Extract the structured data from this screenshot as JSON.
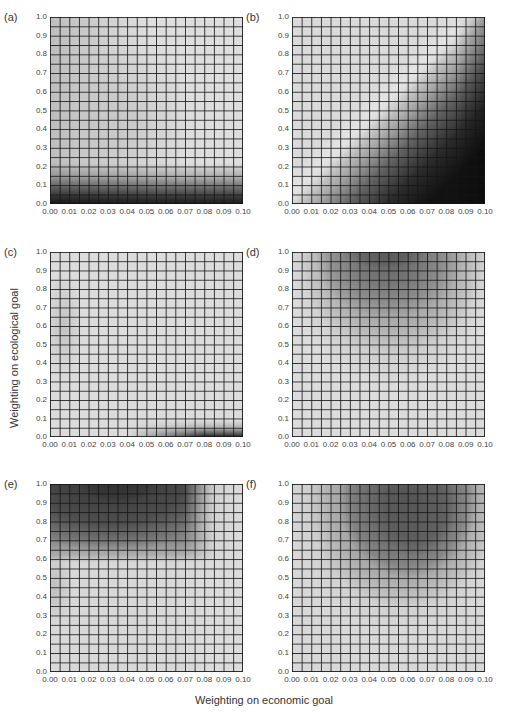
{
  "figure": {
    "xlabel": "Weighting on economic goal",
    "ylabel": "Weighting on ecological goal"
  },
  "chart_data": {
    "type": "heatmap",
    "xlabel": "Weighting on economic goal",
    "ylabel": "Weighting on ecological goal",
    "x_ticks": [
      "0.00",
      "0.01",
      "0.02",
      "0.03",
      "0.04",
      "0.05",
      "0.06",
      "0.07",
      "0.08",
      "0.09",
      "0.10"
    ],
    "y_ticks": [
      "0.0",
      "0.1",
      "0.2",
      "0.3",
      "0.4",
      "0.5",
      "0.6",
      "0.7",
      "0.8",
      "0.9",
      "1.0"
    ],
    "xlim": [
      0,
      0.1
    ],
    "ylim": [
      0,
      1.0
    ],
    "grid": {
      "x_step": 0.005,
      "y_step": 0.05,
      "cols": 20,
      "rows": 20
    },
    "colormap": "grayscale (dark = high)",
    "panels": [
      {
        "label": "(a)",
        "description": "Mostly light; dark band along bottom (ecological weight < ~0.1), darkest at low economic weight",
        "base": "#dedede",
        "layers": [
          "linear-gradient(to top, #1a1a1a 0%, #3a3a3a 4%, #6e6e6e 9%, #a8a8a8 14%, rgba(200,200,200,0) 22%)",
          "linear-gradient(to right, rgba(0,0,0,0.15) 0%, rgba(0,0,0,0) 50%)",
          "radial-gradient(ellipse 30% 45% at 45% 55%, rgba(0,0,0,0.08), rgba(0,0,0,0))"
        ]
      },
      {
        "label": "(b)",
        "description": "Light upper-left; dark diagonal region toward lower-right (high economic, low ecological weight)",
        "base": "#dadada",
        "layers": [
          "linear-gradient(135deg, rgba(0,0,0,0) 48%, rgba(0,0,0,0.25) 56%, rgba(0,0,0,0.55) 64%, rgba(0,0,0,0.8) 74%, rgba(0,0,0,0.92) 85%)",
          "linear-gradient(to left, rgba(0,0,0,0.25) 0%, rgba(0,0,0,0) 15%)",
          "linear-gradient(135deg, rgba(255,255,255,0) 40%, rgba(255,255,255,0.25) 46%, rgba(255,255,255,0) 52%)"
        ]
      },
      {
        "label": "(c)",
        "description": "Mostly light; faint vertical shading near economic 0.00-0.02 for mid ecological; dark wedge lower-right near ecological 0.0",
        "base": "#dcdcdc",
        "layers": [
          "linear-gradient(to top, rgba(0,0,0,0.85) 0%, rgba(0,0,0,0.5) 2.5%, rgba(0,0,0,0.2) 5%, rgba(0,0,0,0) 9%)",
          "linear-gradient(to right, rgba(220,220,220,1) 0%, rgba(220,220,220,1) 40%, rgba(220,220,220,0) 80%)",
          "radial-gradient(ellipse 10% 30% at 7% 40%, rgba(0,0,0,0.12), rgba(0,0,0,0))"
        ]
      },
      {
        "label": "(d)",
        "description": "Dark hump centered near economic 0.045-0.055 at ecological 1.0, lighter concentric bands down to ~0.45",
        "base": "#dcdcdc",
        "layers": [
          "radial-gradient(ellipse 22% 9% at 48% 0%, #1a1a1a 0%, #2e2e2e 60%, rgba(46,46,46,0) 100%)",
          "radial-gradient(ellipse 38% 34% at 50% 2%, rgba(40,40,40,0.9) 0%, rgba(70,70,70,0.75) 45%, rgba(100,100,100,0.55) 75%, rgba(120,120,120,0) 100%)",
          "radial-gradient(ellipse 48% 56% at 52% 0%, rgba(90,90,90,0.5) 0%, rgba(120,120,120,0.45) 70%, rgba(150,150,150,0) 100%)",
          "radial-gradient(ellipse 55% 72% at 52% 0%, rgba(150,150,150,0.3) 0%, rgba(170,170,170,0.25) 80%, rgba(190,190,190,0) 100%)"
        ]
      },
      {
        "label": "(e)",
        "description": "Darkest at top around economic 0.03-0.04 (ecological ~1.0); dark band for ecological > ~0.65 across economic 0.00-0.08; light elsewhere",
        "base": "#d8d8d8",
        "layers": [
          "radial-gradient(ellipse 20% 10% at 36% 0%, #151515 0%, #252525 70%, rgba(37,37,37,0) 100%)",
          "radial-gradient(ellipse 60% 36% at 32% 0%, rgba(30,30,30,0.9) 0%, rgba(60,60,60,0.8) 60%, rgba(80,80,80,0) 100%)",
          "linear-gradient(to bottom, rgba(60,60,60,0.7) 0%, rgba(80,80,80,0.6) 30%, rgba(100,100,100,0.35) 38%, rgba(120,120,120,0) 42%)",
          "linear-gradient(to left, rgba(220,220,220,1) 0%, rgba(220,220,220,0.9) 15%, rgba(220,220,220,0) 30%)",
          "radial-gradient(ellipse 10% 20% at 2% 55%, rgba(0,0,0,0.12), rgba(0,0,0,0))"
        ]
      },
      {
        "label": "(f)",
        "description": "Dark region centered near economic 0.06-0.065 at ecological ~0.8-1.0; concentric lighter bands down to ~0.5",
        "base": "#d8d8d8",
        "layers": [
          "radial-gradient(ellipse 22% 26% at 64% 12%, #111111 0%, #1e1e1e 70%, rgba(30,30,30,0) 100%)",
          "radial-gradient(ellipse 36% 42% at 60% 8%, rgba(25,25,25,0.95) 0%, rgba(50,50,50,0.85) 55%, rgba(80,80,80,0.6) 85%, rgba(100,100,100,0) 100%)",
          "radial-gradient(ellipse 50% 60% at 58% 6%, rgba(90,90,90,0.55) 0%, rgba(120,120,120,0.45) 75%, rgba(150,150,150,0) 100%)",
          "radial-gradient(ellipse 60% 78% at 56% 0%, rgba(150,150,150,0.28) 0%, rgba(170,170,170,0.2) 80%, rgba(190,190,190,0) 100%)"
        ]
      }
    ]
  }
}
